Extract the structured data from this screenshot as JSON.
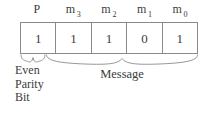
{
  "figure": {
    "line_color": "#8a8a8a",
    "text_color": "#3c3c3c",
    "background": "#ffffff"
  },
  "top_labels": [
    {
      "base": "P",
      "sub": ""
    },
    {
      "base": "m",
      "sub": "3"
    },
    {
      "base": "m",
      "sub": "2"
    },
    {
      "base": "m",
      "sub": "1"
    },
    {
      "base": "m",
      "sub": "0"
    }
  ],
  "bits": [
    {
      "value": "1"
    },
    {
      "value": "1"
    },
    {
      "value": "1"
    },
    {
      "value": "0"
    },
    {
      "value": "1"
    }
  ],
  "captions": {
    "parity": {
      "line1": "Even",
      "line2": "Parity",
      "line3": "Bit"
    },
    "message": "Message"
  }
}
